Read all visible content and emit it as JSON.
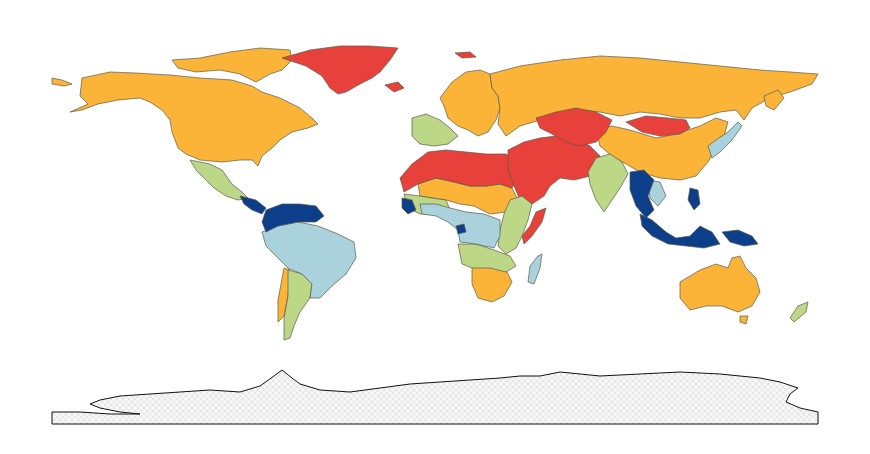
{
  "map": {
    "type": "choropleth-world",
    "legend": null,
    "categories": [
      {
        "id": "cat-red",
        "color": "#e8413b"
      },
      {
        "id": "cat-orange",
        "color": "#fbb437"
      },
      {
        "id": "cat-lightgreen",
        "color": "#bcd886"
      },
      {
        "id": "cat-lightblue",
        "color": "#a9d2dd"
      },
      {
        "id": "cat-darkblue",
        "color": "#0c3e8a"
      },
      {
        "id": "cat-nodata",
        "color": "hatched"
      }
    ],
    "regions": [
      {
        "name": "greenland",
        "category": "cat-red"
      },
      {
        "name": "iceland",
        "category": "cat-red"
      },
      {
        "name": "svalbard",
        "category": "cat-red"
      },
      {
        "name": "north-africa",
        "category": "cat-red"
      },
      {
        "name": "middle-east",
        "category": "cat-red"
      },
      {
        "name": "central-asia",
        "category": "cat-red"
      },
      {
        "name": "mongolia",
        "category": "cat-red"
      },
      {
        "name": "somalia",
        "category": "cat-red"
      },
      {
        "name": "alaska-canada-usa",
        "category": "cat-orange"
      },
      {
        "name": "arctic-islands",
        "category": "cat-orange"
      },
      {
        "name": "northern-europe",
        "category": "cat-orange"
      },
      {
        "name": "russia",
        "category": "cat-orange"
      },
      {
        "name": "china",
        "category": "cat-orange"
      },
      {
        "name": "sahel",
        "category": "cat-orange"
      },
      {
        "name": "southern-africa",
        "category": "cat-orange"
      },
      {
        "name": "australia",
        "category": "cat-orange"
      },
      {
        "name": "chile",
        "category": "cat-orange"
      },
      {
        "name": "mexico",
        "category": "cat-lightgreen"
      },
      {
        "name": "western-europe",
        "category": "cat-lightgreen"
      },
      {
        "name": "india",
        "category": "cat-lightgreen"
      },
      {
        "name": "west-africa",
        "category": "cat-lightgreen"
      },
      {
        "name": "east-africa",
        "category": "cat-lightgreen"
      },
      {
        "name": "south-central-africa",
        "category": "cat-lightgreen"
      },
      {
        "name": "argentina",
        "category": "cat-lightgreen"
      },
      {
        "name": "new-zealand",
        "category": "cat-lightgreen"
      },
      {
        "name": "brazil-andes",
        "category": "cat-lightblue"
      },
      {
        "name": "central-africa",
        "category": "cat-lightblue"
      },
      {
        "name": "madagascar",
        "category": "cat-lightblue"
      },
      {
        "name": "japan-korea",
        "category": "cat-lightblue"
      },
      {
        "name": "indochina-inner",
        "category": "cat-lightblue"
      },
      {
        "name": "central-america",
        "category": "cat-darkblue"
      },
      {
        "name": "northern-south-america",
        "category": "cat-darkblue"
      },
      {
        "name": "guinea-coast",
        "category": "cat-darkblue"
      },
      {
        "name": "gabon",
        "category": "cat-darkblue"
      },
      {
        "name": "southeast-asia",
        "category": "cat-darkblue"
      },
      {
        "name": "indonesia",
        "category": "cat-darkblue"
      },
      {
        "name": "papua",
        "category": "cat-darkblue"
      },
      {
        "name": "antarctica",
        "category": "cat-nodata"
      }
    ]
  }
}
